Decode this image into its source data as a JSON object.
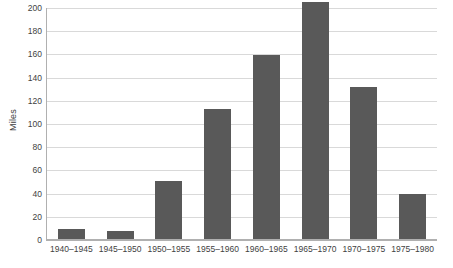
{
  "chart_data": {
    "type": "bar",
    "title": "",
    "xlabel": "",
    "ylabel": "Miles",
    "categories": [
      "1940–1945",
      "1945–1950",
      "1950–1955",
      "1955–1960",
      "1960–1965",
      "1965–1970",
      "1970–1975",
      "1975–1980"
    ],
    "values": [
      9,
      7,
      50,
      112,
      159,
      204,
      131,
      39
    ],
    "ylim": [
      0,
      200
    ],
    "ytick_step": 20,
    "ytick_labels": [
      "0",
      "20",
      "40",
      "60",
      "80",
      "100",
      "120",
      "140",
      "160",
      "180",
      "200"
    ],
    "ytick_values": [
      0,
      20,
      40,
      60,
      80,
      100,
      120,
      140,
      160,
      180,
      200
    ],
    "grid": true,
    "grid_axis": "y",
    "legend": false,
    "legend_position": "none",
    "series": [
      {
        "name": "Miles",
        "values": [
          9,
          7,
          50,
          112,
          159,
          204,
          131,
          39
        ]
      }
    ]
  },
  "style": {
    "bar_color": "#595959",
    "grid_color": "#d9d9d9",
    "axis_color": "#b0b0b0",
    "text_color": "#3f3f3f",
    "background": "#ffffff"
  }
}
